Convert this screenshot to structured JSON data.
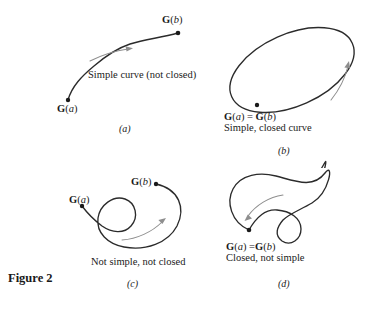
{
  "figure": {
    "caption": "Figure 2",
    "background_color": "#ffffff",
    "curve_color": "#2b2b2b",
    "arrow_color": "#8e8e8e"
  },
  "panels": {
    "a": {
      "letter": "(a)",
      "description": "Simple curve (not closed)",
      "start_label_bold": "G",
      "start_label_paren_open": "(",
      "start_label_italic": "a",
      "start_label_paren_close": ")",
      "end_label_bold": "G",
      "end_label_paren_open": "(",
      "end_label_italic": "b",
      "end_label_paren_close": ")",
      "curve_type": "open-s-curve",
      "direction": "forward"
    },
    "b": {
      "letter": "(b)",
      "description": "Simple, closed curve",
      "point_bold_1": "G",
      "point_italic_1": "a",
      "equals": "=",
      "point_bold_2": "G",
      "point_italic_2": "b",
      "curve_type": "tilted-ellipse",
      "direction": "counterclockwise"
    },
    "c": {
      "letter": "(c)",
      "description": "Not simple, not closed",
      "start_label_bold": "G",
      "start_label_italic": "a",
      "end_label_bold": "G",
      "end_label_italic": "b",
      "curve_type": "open-curve-with-loop",
      "direction": "forward"
    },
    "d": {
      "letter": "(d)",
      "description": "Closed, not simple",
      "point_bold_1": "G",
      "point_italic_1": "a",
      "equals": "=",
      "point_bold_2": "G",
      "point_italic_2": "b",
      "curve_type": "closed-bean-with-loop",
      "direction": "counterclockwise"
    }
  }
}
